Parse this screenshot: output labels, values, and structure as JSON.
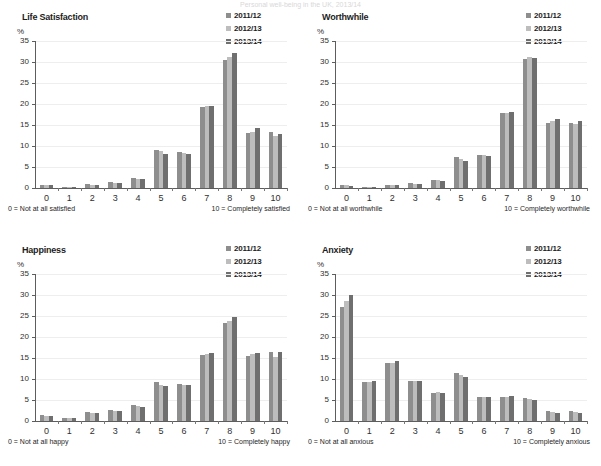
{
  "page": {
    "top_title_fragment": "Personal well-being in the UK, 2013/14"
  },
  "series_colors": {
    "2011/12": "#8e8e8e",
    "2012/13": "#bdbdbd",
    "2013/14": "#6f6f6f"
  },
  "legend": {
    "items": [
      {
        "label": "2011/12",
        "color": "#8e8e8e"
      },
      {
        "label": "2012/13",
        "color": "#bdbdbd"
      },
      {
        "label": "2013/14",
        "color": "#6f6f6f"
      }
    ]
  },
  "axis": {
    "unit": "%",
    "yticks": [
      "0",
      "5",
      "10",
      "15",
      "20",
      "25",
      "30",
      "35"
    ],
    "xticks": [
      "0",
      "1",
      "2",
      "3",
      "4",
      "5",
      "6",
      "7",
      "8",
      "9",
      "10"
    ]
  },
  "chart_data": [
    {
      "type": "bar",
      "title": "Life Satisfaction",
      "xlabel": "",
      "ylabel": "%",
      "ylim": [
        0,
        35
      ],
      "grid": true,
      "legend_position": "top-right",
      "categories": [
        "0",
        "1",
        "2",
        "3",
        "4",
        "5",
        "6",
        "7",
        "8",
        "9",
        "10"
      ],
      "footnote_left": "0 = Not at all satisfied",
      "footnote_right": "10 = Completely satisfied",
      "series": [
        {
          "name": "2011/12",
          "values": [
            0.7,
            0.3,
            0.9,
            1.4,
            2.5,
            9.1,
            8.5,
            19.3,
            30.5,
            13.1,
            13.3
          ]
        },
        {
          "name": "2012/13",
          "values": [
            0.6,
            0.3,
            0.8,
            1.3,
            2.2,
            8.7,
            8.4,
            19.5,
            31.1,
            13.3,
            12.4
          ]
        },
        {
          "name": "2013/14",
          "values": [
            0.6,
            0.3,
            0.8,
            1.2,
            2.1,
            8.0,
            8.0,
            19.5,
            32.2,
            14.2,
            12.8
          ]
        }
      ]
    },
    {
      "type": "bar",
      "title": "Worthwhile",
      "xlabel": "",
      "ylabel": "%",
      "ylim": [
        0,
        35
      ],
      "grid": true,
      "legend_position": "top-right",
      "categories": [
        "0",
        "1",
        "2",
        "3",
        "4",
        "5",
        "6",
        "7",
        "8",
        "9",
        "10"
      ],
      "footnote_left": "0 = Not at all worthwhile",
      "footnote_right": "10 = Completely worthwhile",
      "series": [
        {
          "name": "2011/12",
          "values": [
            0.6,
            0.3,
            0.8,
            1.1,
            2.0,
            7.3,
            7.9,
            17.9,
            30.6,
            15.4,
            15.4
          ]
        },
        {
          "name": "2012/13",
          "values": [
            0.6,
            0.3,
            0.7,
            1.0,
            1.8,
            6.8,
            7.8,
            17.9,
            31.1,
            16.0,
            15.3
          ]
        },
        {
          "name": "2013/14",
          "values": [
            0.5,
            0.3,
            0.7,
            1.0,
            1.7,
            6.5,
            7.6,
            18.0,
            31.0,
            16.5,
            15.9
          ]
        }
      ]
    },
    {
      "type": "bar",
      "title": "Happiness",
      "xlabel": "",
      "ylabel": "%",
      "ylim": [
        0,
        35
      ],
      "grid": true,
      "legend_position": "top-right",
      "categories": [
        "0",
        "1",
        "2",
        "3",
        "4",
        "5",
        "6",
        "7",
        "8",
        "9",
        "10"
      ],
      "footnote_left": "0 = Not at all happy",
      "footnote_right": "10 = Completely happy",
      "series": [
        {
          "name": "2011/12",
          "values": [
            1.4,
            0.8,
            2.1,
            2.6,
            3.8,
            9.4,
            8.8,
            15.8,
            23.4,
            15.4,
            16.5
          ]
        },
        {
          "name": "2012/13",
          "values": [
            1.1,
            0.7,
            1.9,
            2.5,
            3.6,
            8.6,
            8.6,
            16.0,
            23.8,
            15.9,
            15.2
          ]
        },
        {
          "name": "2013/14",
          "values": [
            1.1,
            0.7,
            2.0,
            2.5,
            3.4,
            8.4,
            8.6,
            16.1,
            24.7,
            16.3,
            16.4
          ]
        }
      ]
    },
    {
      "type": "bar",
      "title": "Anxiety",
      "xlabel": "",
      "ylabel": "%",
      "ylim": [
        0,
        35
      ],
      "grid": true,
      "legend_position": "top-right",
      "categories": [
        "0",
        "1",
        "2",
        "3",
        "4",
        "5",
        "6",
        "7",
        "8",
        "9",
        "10"
      ],
      "footnote_left": "0 = Not at all anxious",
      "footnote_right": "10 = Completely anxious",
      "series": [
        {
          "name": "2011/12",
          "values": [
            27.2,
            9.4,
            13.8,
            9.5,
            6.7,
            11.4,
            5.6,
            5.8,
            5.5,
            2.3,
            2.4
          ]
        },
        {
          "name": "2012/13",
          "values": [
            28.5,
            9.4,
            13.9,
            9.5,
            6.8,
            11.0,
            5.7,
            5.7,
            5.3,
            2.2,
            2.2
          ]
        },
        {
          "name": "2013/14",
          "values": [
            30.0,
            9.5,
            14.2,
            9.5,
            6.6,
            10.4,
            5.7,
            5.9,
            4.9,
            1.9,
            2.0
          ]
        }
      ]
    }
  ]
}
